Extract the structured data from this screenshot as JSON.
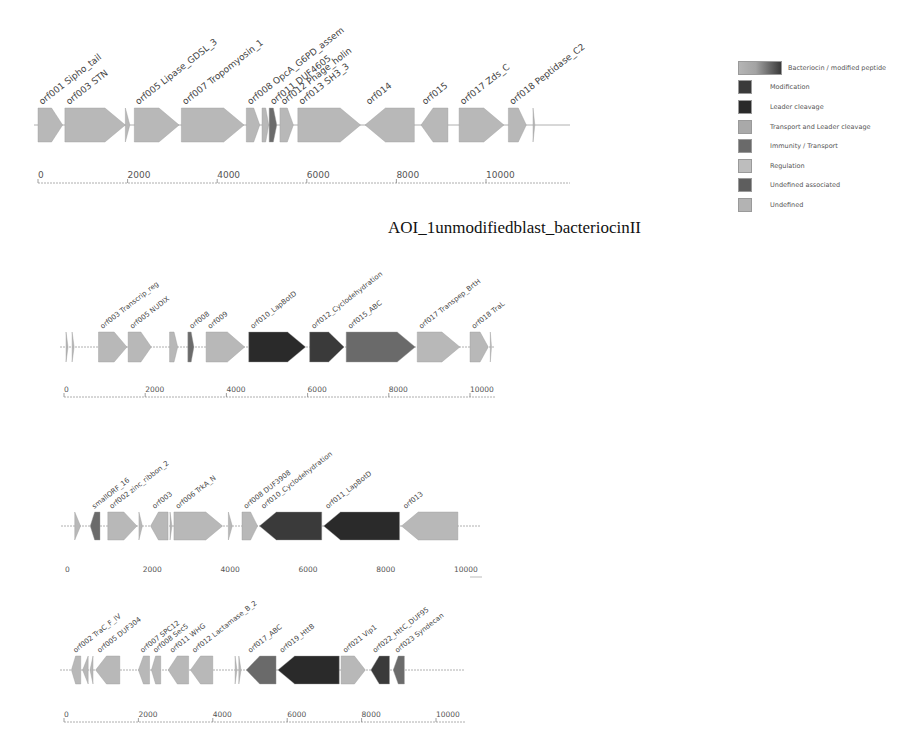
{
  "title": "AOI_1unmodifiedblast_bacteriocinII",
  "legend": {
    "items": [
      {
        "label": "Bacteriocin / modified peptide",
        "color": "#8c8c8c"
      },
      {
        "label": "Modification",
        "color": "#3a3a3a"
      },
      {
        "label": "Leader cleavage",
        "color": "#2a2a2a"
      },
      {
        "label": "Transport and Leader cleavage",
        "color": "#a9a9a9"
      },
      {
        "label": "Immunity / Transport",
        "color": "#6a6a6a"
      },
      {
        "label": "Regulation",
        "color": "#bdbdbd"
      },
      {
        "label": "Undefined associated",
        "color": "#5e5e5e"
      },
      {
        "label": "Undefined",
        "color": "#b3b3b3"
      }
    ]
  },
  "chart_data": [
    {
      "type": "gene_cluster_map",
      "title": "",
      "xlabel": "bp",
      "axis": {
        "ticks": [
          0,
          2000,
          4000,
          6000,
          8000,
          10000
        ],
        "range": [
          0,
          11800
        ]
      },
      "genes": [
        {
          "label": "orf001 Sipho_tail",
          "start": 0,
          "end": 550,
          "strand": "+",
          "category": "Undefined"
        },
        {
          "label": "orf003 STN",
          "start": 600,
          "end": 1950,
          "strand": "+",
          "category": "Undefined"
        },
        {
          "label": "",
          "start": 1950,
          "end": 2050,
          "strand": "+",
          "category": "Undefined"
        },
        {
          "label": "orf005 Lipase_GDSL_3",
          "start": 2150,
          "end": 3150,
          "strand": "+",
          "category": "Undefined"
        },
        {
          "label": "orf007 Tropomyosin_1",
          "start": 3200,
          "end": 4600,
          "strand": "+",
          "category": "Undefined"
        },
        {
          "label": "orf008 OpcA_G6PD_assem",
          "start": 4650,
          "end": 4950,
          "strand": "+",
          "category": "Undefined"
        },
        {
          "label": "",
          "start": 5000,
          "end": 5150,
          "strand": "+",
          "category": "Undefined"
        },
        {
          "label": "orf011 DUF4605",
          "start": 5160,
          "end": 5330,
          "strand": "+",
          "category": "Undefined associated"
        },
        {
          "label": "orf012 Phage_holin",
          "start": 5400,
          "end": 5700,
          "strand": "+",
          "category": "Undefined"
        },
        {
          "label": "orf013 SH3_3",
          "start": 5800,
          "end": 7200,
          "strand": "+",
          "category": "Undefined"
        },
        {
          "label": "orf014",
          "start": 7300,
          "end": 8400,
          "strand": "-",
          "category": "Undefined"
        },
        {
          "label": "orf015",
          "start": 8550,
          "end": 9150,
          "strand": "-",
          "category": "Undefined"
        },
        {
          "label": "orf017 Zds_C",
          "start": 9400,
          "end": 10400,
          "strand": "+",
          "category": "Undefined"
        },
        {
          "label": "orf018 Peptidase_C2",
          "start": 10500,
          "end": 10900,
          "strand": "+",
          "category": "Undefined"
        },
        {
          "label": "",
          "start": 11050,
          "end": 11090,
          "strand": "+",
          "category": "Undefined"
        }
      ]
    },
    {
      "type": "gene_cluster_map",
      "title": "AOI_1unmodifiedblast_bacteriocinII",
      "axis": {
        "ticks": [
          0,
          2000,
          4000,
          6000,
          8000,
          10000
        ],
        "range": [
          0,
          11000
        ]
      },
      "genes": [
        {
          "label": "",
          "start": 50,
          "end": 100,
          "strand": "+",
          "category": "Undefined"
        },
        {
          "label": "",
          "start": 200,
          "end": 250,
          "strand": "+",
          "category": "Undefined"
        },
        {
          "label": "orf003 Transcrip_reg",
          "start": 850,
          "end": 1550,
          "strand": "+",
          "category": "Undefined"
        },
        {
          "label": "orf005 NUDIX",
          "start": 1580,
          "end": 2150,
          "strand": "+",
          "category": "Undefined"
        },
        {
          "label": "",
          "start": 2600,
          "end": 2800,
          "strand": "+",
          "category": "Undefined"
        },
        {
          "label": "orf008",
          "start": 3050,
          "end": 3200,
          "strand": "+",
          "category": "Undefined associated"
        },
        {
          "label": "orf009",
          "start": 3500,
          "end": 4450,
          "strand": "+",
          "category": "Undefined"
        },
        {
          "label": "orf010_LapBotD",
          "start": 4550,
          "end": 5950,
          "strand": "+",
          "category": "Leader cleavage"
        },
        {
          "label": "orf012_Cyclodehydration",
          "start": 6050,
          "end": 6900,
          "strand": "+",
          "category": "Modification"
        },
        {
          "label": "orf015_ABC",
          "start": 6950,
          "end": 8650,
          "strand": "+",
          "category": "Immunity / Transport"
        },
        {
          "label": "orf017 Transpep_BrtH",
          "start": 8700,
          "end": 9750,
          "strand": "+",
          "category": "Undefined"
        },
        {
          "label": "orf018 TraL",
          "start": 10000,
          "end": 10450,
          "strand": "+",
          "category": "Undefined"
        },
        {
          "label": "",
          "start": 10500,
          "end": 10530,
          "strand": "+",
          "category": "Undefined"
        }
      ]
    },
    {
      "type": "gene_cluster_map",
      "title": "",
      "axis": {
        "ticks": [
          0,
          2000,
          4000,
          6000,
          8000,
          10000
        ],
        "range": [
          0,
          11200
        ]
      },
      "genes": [
        {
          "label": "",
          "start": 250,
          "end": 400,
          "strand": "+",
          "category": "Undefined"
        },
        {
          "label": "smallORF_16",
          "start": 650,
          "end": 900,
          "strand": "-",
          "category": "Undefined associated"
        },
        {
          "label": "orf002 zinc_ribbon_2",
          "start": 1100,
          "end": 1850,
          "strand": "+",
          "category": "Undefined"
        },
        {
          "label": "",
          "start": 1900,
          "end": 1990,
          "strand": "+",
          "category": "Undefined"
        },
        {
          "label": "orf003",
          "start": 2200,
          "end": 2650,
          "strand": "-",
          "category": "Undefined"
        },
        {
          "label": "",
          "start": 2700,
          "end": 2750,
          "strand": "+",
          "category": "Undefined"
        },
        {
          "label": "orf006 TrkA_N",
          "start": 2800,
          "end": 4050,
          "strand": "+",
          "category": "Undefined"
        },
        {
          "label": "",
          "start": 4200,
          "end": 4300,
          "strand": "+",
          "category": "Undefined"
        },
        {
          "label": "orf008 DUF3908",
          "start": 4550,
          "end": 4950,
          "strand": "+",
          "category": "Undefined"
        },
        {
          "label": "orf010_Cyclodehydration",
          "start": 5000,
          "end": 6600,
          "strand": "-",
          "category": "Modification"
        },
        {
          "label": "orf011_LapBotD",
          "start": 6650,
          "end": 8600,
          "strand": "-",
          "category": "Leader cleavage"
        },
        {
          "label": "orf013",
          "start": 8650,
          "end": 10100,
          "strand": "-",
          "category": "Undefined"
        }
      ]
    },
    {
      "type": "gene_cluster_map",
      "title": "",
      "axis": {
        "ticks": [
          0,
          2000,
          4000,
          6000,
          8000,
          10000
        ],
        "range": [
          0,
          11200
        ]
      },
      "genes": [
        {
          "label": "orf002 TraC_F_IV",
          "start": 200,
          "end": 450,
          "strand": "-",
          "category": "Undefined"
        },
        {
          "label": "",
          "start": 500,
          "end": 650,
          "strand": "-",
          "category": "Undefined"
        },
        {
          "label": "",
          "start": 700,
          "end": 780,
          "strand": "-",
          "category": "Undefined"
        },
        {
          "label": "orf005 DUF304",
          "start": 850,
          "end": 1500,
          "strand": "-",
          "category": "Undefined"
        },
        {
          "label": "orf007 SPC12",
          "start": 2000,
          "end": 2300,
          "strand": "-",
          "category": "Undefined"
        },
        {
          "label": "orf008 Sec5",
          "start": 2350,
          "end": 2600,
          "strand": "-",
          "category": "Undefined"
        },
        {
          "label": "orf011 WHG",
          "start": 2800,
          "end": 3350,
          "strand": "-",
          "category": "Undefined"
        },
        {
          "label": "orf012 Lactamase_B_2",
          "start": 3400,
          "end": 4000,
          "strand": "-",
          "category": "Undefined"
        },
        {
          "label": "",
          "start": 4600,
          "end": 4650,
          "strand": "+",
          "category": "Undefined"
        },
        {
          "label": "",
          "start": 4700,
          "end": 4760,
          "strand": "+",
          "category": "Undefined"
        },
        {
          "label": "orf017_ABC",
          "start": 4900,
          "end": 5700,
          "strand": "-",
          "category": "Immunity / Transport"
        },
        {
          "label": "orf019_HttB",
          "start": 5750,
          "end": 7400,
          "strand": "-",
          "category": "Leader cleavage"
        },
        {
          "label": "orf021 Vip1",
          "start": 7450,
          "end": 8100,
          "strand": "+",
          "category": "Undefined"
        },
        {
          "label": "orf022_HttC_DUF95",
          "start": 8250,
          "end": 8750,
          "strand": "-",
          "category": "Modification"
        },
        {
          "label": "orf023 Syndecan",
          "start": 8850,
          "end": 9150,
          "strand": "-",
          "category": "Undefined associated"
        }
      ]
    }
  ],
  "layout": {
    "panels": [
      {
        "x0": 38,
        "pxPerKb": 44.8,
        "trackY": 125,
        "h": 34,
        "axisY": 183,
        "tickLabelY": 178,
        "lineEnd": 570
      },
      {
        "x0": 64,
        "pxPerKb": 40.6,
        "trackY": 347,
        "h": 30,
        "axisY": 397,
        "tickLabelY": 392,
        "lineEnd": 495
      },
      {
        "x0": 65,
        "pxPerKb": 38.9,
        "trackY": 526,
        "h": 28,
        "axisY": 0,
        "tickLabelY": 572,
        "lineEnd": 480
      },
      {
        "x0": 64,
        "pxPerKb": 37.2,
        "trackY": 670,
        "h": 28,
        "axisY": 722,
        "tickLabelY": 717,
        "lineEnd": 465
      }
    ]
  }
}
